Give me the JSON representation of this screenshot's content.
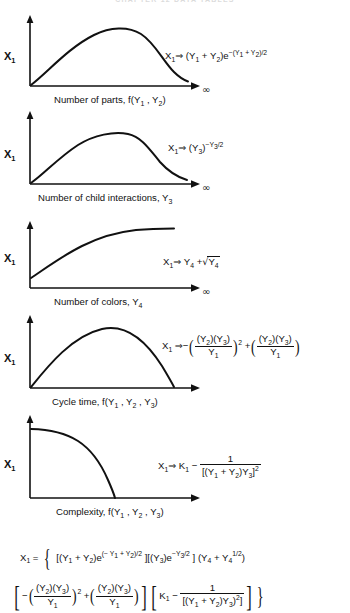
{
  "running_head": "CHAPTER 12   DATA TABLES",
  "figure": {
    "panels": [
      {
        "id": "panel-parts",
        "y_label": "X",
        "y_label_sub": "1",
        "x_label": "Number of parts, f(Y₁ , Y₂)",
        "x_label_plain": "Number of parts, f(Y1, Y2)",
        "infinity_symbol": "∞",
        "curve_shape": "rise-peak-fall",
        "equation_plain": "X1 ⇒ (Y1 + Y2)e−(Y1 + Y2)/2",
        "equation_parts": {
          "lhs_var": "X",
          "lhs_sub": "1",
          "arrow": "⇒",
          "base_open": "(Y",
          "b1": "1",
          "plus": " + Y",
          "b2": "2",
          "base_close": ")e",
          "exp": "−(Y₁ + Y₂)/2"
        }
      },
      {
        "id": "panel-child-interactions",
        "y_label": "X",
        "y_label_sub": "1",
        "x_label": "Number of child interactions, Y₃",
        "x_label_plain": "Number of child interactions, Y3",
        "infinity_symbol": "∞",
        "curve_shape": "rise-peak-fall",
        "equation_plain": "X1 ⇒ (Y3)−Y3/2"
      },
      {
        "id": "panel-colors",
        "y_label": "X",
        "y_label_sub": "1",
        "x_label": "Number of colors, Y₄",
        "x_label_plain": "Number of colors, Y4",
        "infinity_symbol": "∞",
        "curve_shape": "concave-asymptotic-rise",
        "equation_plain": "X1 ⇒ Y4 + √Y4"
      },
      {
        "id": "panel-cycle-time",
        "y_label": "X",
        "y_label_sub": "1",
        "x_label": "Cycle time, f(Y₁ , Y₂ , Y₃)",
        "x_label_plain": "Cycle time, f(Y1, Y2, Y3)",
        "infinity_symbol": "",
        "curve_shape": "inverted-parabola",
        "equation_plain": "X1 ⇒ −((Y2)(Y3)/Y1)² + ((Y2)(Y3)/Y1)"
      },
      {
        "id": "panel-complexity",
        "y_label": "X",
        "y_label_sub": "1",
        "x_label": "Complexity, f(Y₁ , Y₂ , Y₃)",
        "x_label_plain": "Complexity, f(Y1, Y2, Y3)",
        "infinity_symbol": "",
        "curve_shape": "plateau-then-steep-fall",
        "equation_plain": "X1 ⇒ K1 − 1/[(Y1 + Y2)Y3]²"
      }
    ],
    "final_equation": {
      "line1_plain": "X1 = { [(Y1 + Y2)e(− Y1 + Y2)/2 ][(Y3)e−Y3/2 ] (Y4 + Y4 1/2)",
      "line2_plain": "[ −((Y2)(Y3)/Y1)2 + ((Y2)(Y3)/Y1) ][ K1 − 1/[(Y1 + Y2)Y3)2] ] }",
      "tokens": {
        "x": "X",
        "x_sub": "1",
        "equals": "=",
        "open_brace": "{",
        "close_brace": "}",
        "k": "K",
        "k_sub": "1",
        "minus": "−",
        "plus": "+",
        "one": "1",
        "exp_half": "1/2",
        "sq": "2"
      }
    }
  },
  "symbols": {
    "implies": "⇒",
    "infinity": "∞",
    "minus": "−",
    "sqrt": "√"
  },
  "colors": {
    "ink": "#111111",
    "paper": "#ffffff",
    "faint": "#bfbfbf"
  }
}
